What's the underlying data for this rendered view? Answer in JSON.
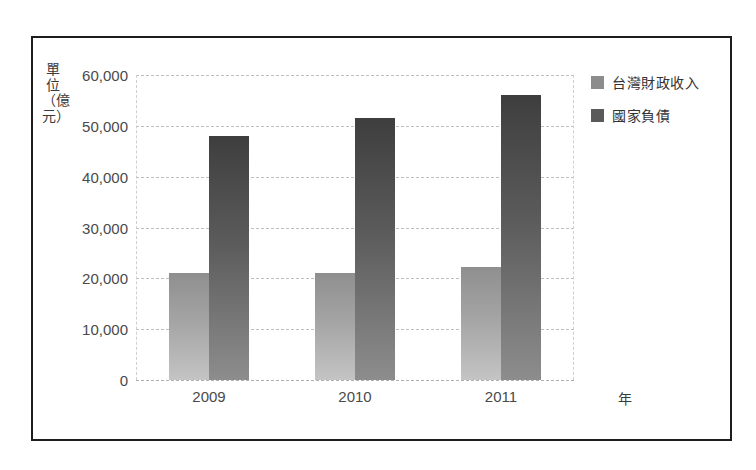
{
  "chart_data": {
    "type": "bar",
    "title": "",
    "subtitle": "",
    "categories": [
      "2009",
      "2010",
      "2011"
    ],
    "series": [
      {
        "name": "台灣財政收入",
        "values": [
          21000,
          21000,
          22300
        ],
        "color": "#8c8c8c"
      },
      {
        "name": "國家負債",
        "values": [
          48000,
          51500,
          56000
        ],
        "color": "#5a5a5a"
      }
    ],
    "xlabel": "年",
    "ylabel": "單位（億元）",
    "ylim": [
      0,
      60000
    ],
    "ytick_labels": [
      "60,000",
      "50,000",
      "40,000",
      "30,000",
      "20,000",
      "10,000",
      "0"
    ],
    "ytick_values": [
      60000,
      50000,
      40000,
      30000,
      20000,
      10000,
      0
    ],
    "grid": true,
    "grid_style": "dashed-horizontal",
    "legend_position": "right-top",
    "frame": true
  },
  "axes": {
    "y_title": "單位（億元）",
    "x_title": "年",
    "y_ticks": [
      {
        "label": "60,000",
        "value": 60000
      },
      {
        "label": "50,000",
        "value": 50000
      },
      {
        "label": "40,000",
        "value": 40000
      },
      {
        "label": "30,000",
        "value": 30000
      },
      {
        "label": "20,000",
        "value": 20000
      },
      {
        "label": "10,000",
        "value": 10000
      },
      {
        "label": "0",
        "value": 0
      }
    ],
    "x_ticks": [
      {
        "label": "2009"
      },
      {
        "label": "2010"
      },
      {
        "label": "2011"
      }
    ]
  },
  "legend": {
    "items": [
      {
        "label": "台灣財政收入",
        "swatch": "revenue-swatch-icon"
      },
      {
        "label": "國家負債",
        "swatch": "debt-swatch-icon"
      }
    ]
  }
}
